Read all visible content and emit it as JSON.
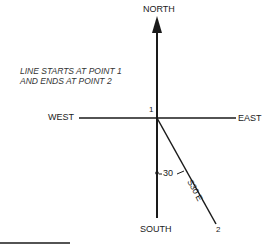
{
  "directions": {
    "north": "NORTH",
    "south": "SOUTH",
    "east": "EAST",
    "west": "WEST"
  },
  "note": {
    "line1": "LINE STARTS AT POINT 1",
    "line2": "AND ENDS AT POINT 2"
  },
  "points": {
    "start": "1",
    "end": "2"
  },
  "angle_label": "30",
  "bearing_label": "S30 E",
  "colors": {
    "ink": "#1a1a1a",
    "background": "#ffffff"
  }
}
